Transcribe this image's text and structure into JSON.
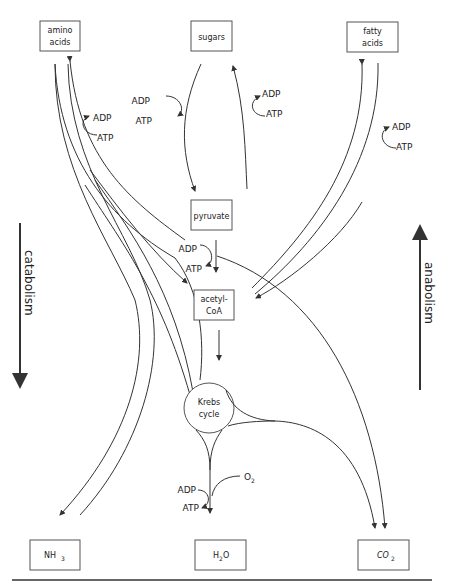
{
  "boxes": {
    "amino_acids": {
      "line1": "amino",
      "line2": "acids"
    },
    "sugars": {
      "label": "sugars"
    },
    "fatty_acids": {
      "line1": "fatty",
      "line2": "acids"
    },
    "pyruvate": {
      "label": "pyruvate"
    },
    "acetyl_coa": {
      "line1": "acetyl-",
      "line2": "CoA"
    },
    "krebs": {
      "line1": "Krebs",
      "line2": "cycle"
    },
    "nh3": {
      "base": "NH",
      "sub": "3"
    },
    "h2o": {
      "base1": "H",
      "sub": "2",
      "base2": "O"
    },
    "co2": {
      "base": "CO",
      "sub": "2"
    }
  },
  "energy": {
    "amino": {
      "adp": "ADP",
      "atp": "ATP"
    },
    "sugars_left": {
      "adp": "ADP",
      "atp": "ATP"
    },
    "sugars_right": {
      "adp": "ADP",
      "atp": "ATP"
    },
    "fatty": {
      "adp": "ADP",
      "atp": "ATP"
    },
    "pyruvate": {
      "adp": "ADP",
      "atp": "ATP"
    },
    "krebs": {
      "adp": "ADP",
      "atp": "ATP",
      "o2_base": "O",
      "o2_sub": "2"
    }
  },
  "side": {
    "left": "catabolism",
    "right": "anabolism"
  }
}
